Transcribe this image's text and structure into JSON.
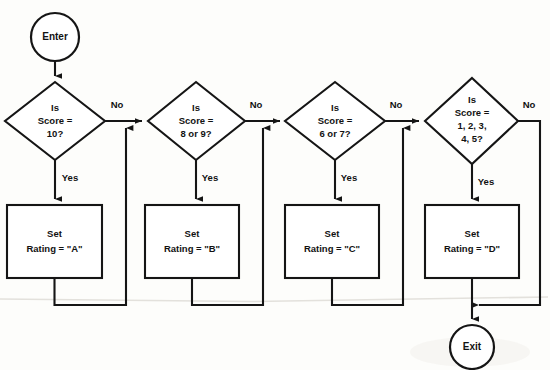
{
  "diagram": {
    "background_color": "#fdfdfb",
    "line_color": "#151515",
    "shape_fill": "#ffffff",
    "terminators": {
      "start_label": "Enter",
      "end_label": "Exit"
    },
    "decisions": [
      {
        "id": "d1",
        "line1": "Is",
        "line2": "Score =",
        "line3": "10?",
        "line4": "",
        "yes_label": "Yes",
        "no_label": "No"
      },
      {
        "id": "d2",
        "line1": "Is",
        "line2": "Score =",
        "line3": "8 or 9?",
        "line4": "",
        "yes_label": "Yes",
        "no_label": "No"
      },
      {
        "id": "d3",
        "line1": "Is",
        "line2": "Score =",
        "line3": "6 or 7?",
        "line4": "",
        "yes_label": "Yes",
        "no_label": "No"
      },
      {
        "id": "d4",
        "line1": "Is",
        "line2": "Score =",
        "line3": "1, 2, 3,",
        "line4": "4, 5?",
        "yes_label": "Yes",
        "no_label": "No"
      }
    ],
    "processes": [
      {
        "id": "p1",
        "line1": "Set",
        "line2": "Rating = \"A\""
      },
      {
        "id": "p2",
        "line1": "Set",
        "line2": "Rating = \"B\""
      },
      {
        "id": "p3",
        "line1": "Set",
        "line2": "Rating = \"C\""
      },
      {
        "id": "p4",
        "line1": "Set",
        "line2": "Rating = \"D\""
      }
    ]
  }
}
